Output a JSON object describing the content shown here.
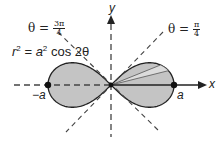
{
  "figure": {
    "equation": {
      "lhs_var": "r",
      "lhs_exp": "2",
      "eq": " = ",
      "rhs_var": "a",
      "rhs_exp": "2",
      "rhs_func": " cos 2θ"
    },
    "angle_left": {
      "prefix": "θ = ",
      "num": "3π",
      "den": "4"
    },
    "angle_right": {
      "prefix": "θ = ",
      "num": "π",
      "den": "4"
    },
    "axis_x_label": "x",
    "axis_y_label": "y",
    "point_right_label": "a",
    "point_left_label": "−a"
  },
  "colors": {
    "lobe_fill": "#c4c4c4",
    "wedge_fill": "#dcdcdc",
    "stroke": "#222222",
    "dashed": "#444444"
  },
  "chart_data": {
    "type": "polar-curve",
    "equation": "r^2 = a^2 cos 2θ",
    "asymptote_lines": [
      "θ = π/4",
      "θ = 3π/4"
    ],
    "points": [
      {
        "label": "a",
        "x": 1,
        "y": 0
      },
      {
        "label": "−a",
        "x": -1,
        "y": 0
      }
    ],
    "xlabel": "x",
    "ylabel": "y",
    "shaded": "both lobes",
    "highlighted_wedge": "thin sector in right lobe near θ≈15°–20°"
  }
}
